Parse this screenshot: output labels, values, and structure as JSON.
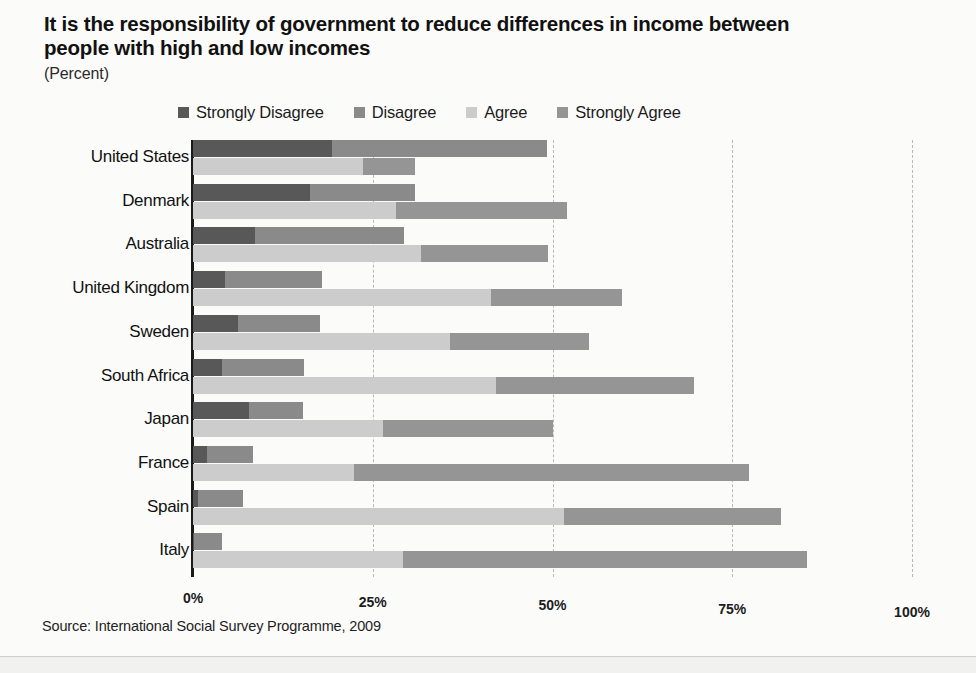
{
  "header": {
    "title": "It is the responsibility of government to reduce differences in income between people with high and low incomes",
    "subtitle": "(Percent)"
  },
  "source": {
    "note": "Source: International Social Survey Programme, 2009"
  },
  "chart_data": {
    "type": "bar",
    "orientation": "horizontal",
    "title": "It is the responsibility of government to reduce differences in income between people with high and low incomes",
    "subtitle": "(Percent)",
    "xlabel": "",
    "ylabel": "",
    "xlim": [
      0,
      100
    ],
    "grid": true,
    "grid_style": "dashed-vertical",
    "legend_position": "top",
    "tick_labels": [
      "0%",
      "25%",
      "50%",
      "75%",
      "100%"
    ],
    "tick_values": [
      0,
      25,
      50,
      75,
      100
    ],
    "categories": [
      "United States",
      "Denmark",
      "Australia",
      "United Kingdom",
      "Sweden",
      "South Africa",
      "Japan",
      "France",
      "Spain",
      "Italy"
    ],
    "series": [
      {
        "name": "Strongly Disagree",
        "color": "#585858",
        "bar": "upper",
        "values": [
          19.3,
          16.3,
          8.6,
          4.4,
          6.2,
          4.0,
          7.8,
          1.9,
          0.7,
          0.1
        ]
      },
      {
        "name": "Disagree",
        "color": "#8a8a8a",
        "bar": "upper",
        "values": [
          29.9,
          14.6,
          20.8,
          13.6,
          11.4,
          11.5,
          7.5,
          6.4,
          6.2,
          3.9
        ]
      },
      {
        "name": "Agree",
        "color": "#cccccc",
        "bar": "lower",
        "values": [
          23.6,
          28.3,
          31.7,
          41.5,
          35.7,
          42.2,
          26.4,
          22.4,
          51.6,
          29.2
        ]
      },
      {
        "name": "Strongly Agree",
        "color": "#959595",
        "bar": "lower",
        "values": [
          7.3,
          23.7,
          17.7,
          18.1,
          19.4,
          27.5,
          23.7,
          55.0,
          30.2,
          56.2
        ]
      }
    ],
    "stacked_totals": {
      "upper_bar": [
        49.2,
        30.9,
        29.4,
        18.0,
        17.6,
        15.5,
        15.3,
        8.3,
        6.9,
        4.0
      ],
      "lower_bar": [
        30.9,
        52.0,
        49.4,
        59.6,
        55.1,
        69.7,
        50.1,
        77.4,
        81.8,
        85.4
      ]
    }
  },
  "legend": {
    "items": [
      {
        "label": "Strongly Disagree",
        "color": "#585858"
      },
      {
        "label": "Disagree",
        "color": "#8a8a8a"
      },
      {
        "label": "Agree",
        "color": "#cccccc"
      },
      {
        "label": "Strongly Agree",
        "color": "#959595"
      }
    ]
  }
}
